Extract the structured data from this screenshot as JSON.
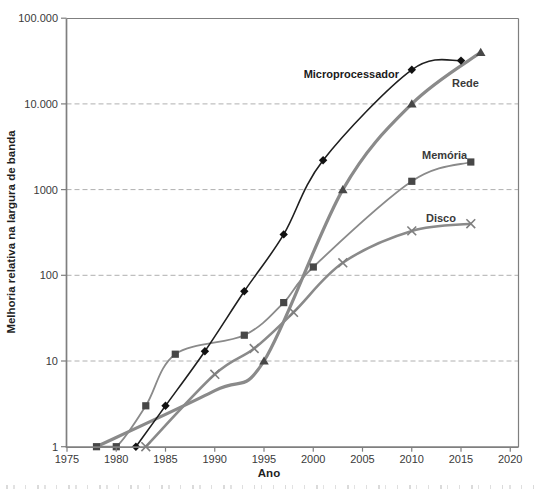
{
  "page": {
    "background": "#ffffff"
  },
  "colors": {
    "frame": "#7f7f7f",
    "grid": "#b0b0b0",
    "tick_text": "#3a3a3a",
    "micro_line": "#1f1f1f",
    "gray_line": "#8a8a8a",
    "dark_marker": "#474747"
  },
  "chart_data": {
    "type": "line",
    "title": "",
    "xlabel": "Ano",
    "ylabel": "Melhoria relativa na largura de banda",
    "x_axis": {
      "min": 1975,
      "max": 2021,
      "tick_step": 5
    },
    "y_axis": {
      "scale": "log",
      "min": 1,
      "max": 100000
    },
    "grid": "horizontal dashed at 10, 100, 1000, 10.000",
    "legend_position": "inline labels next to curves",
    "x_ticks": [
      {
        "label": "1975",
        "value": 1975
      },
      {
        "label": "1980",
        "value": 1980
      },
      {
        "label": "1985",
        "value": 1985
      },
      {
        "label": "1990",
        "value": 1990
      },
      {
        "label": "1995",
        "value": 1995
      },
      {
        "label": "2000",
        "value": 2000
      },
      {
        "label": "2005",
        "value": 2005
      },
      {
        "label": "2010",
        "value": 2010
      },
      {
        "label": "2015",
        "value": 2015
      },
      {
        "label": "2020",
        "value": 2020
      }
    ],
    "y_ticks": [
      {
        "label": "1",
        "value": 1,
        "grid": false
      },
      {
        "label": "10",
        "value": 10,
        "grid": true
      },
      {
        "label": "100",
        "value": 100,
        "grid": true
      },
      {
        "label": "1000",
        "value": 1000,
        "grid": true
      },
      {
        "label": "10.000",
        "value": 10000,
        "grid": true
      },
      {
        "label": "100.000",
        "value": 100000,
        "grid": false
      }
    ],
    "series": [
      {
        "name": "Rede",
        "marker": "triangle",
        "color": "#8a8a8a",
        "marker_color": "#474747",
        "line_width": 3.2,
        "points": [
          [
            1995,
            10
          ],
          [
            2003,
            1000
          ],
          [
            2010,
            10000
          ],
          [
            2017,
            40000
          ]
        ],
        "line_points": [
          [
            1978,
            1
          ],
          [
            1990,
            4.5
          ],
          [
            1995,
            10
          ],
          [
            2003,
            1000
          ],
          [
            2010,
            10000
          ],
          [
            2017,
            40000
          ]
        ]
      },
      {
        "name": "Disco",
        "marker": "x",
        "color": "#8a8a8a",
        "marker_color": "#7f7f7f",
        "line_width": 2.6,
        "points": [
          [
            1983,
            1
          ],
          [
            1990,
            7
          ],
          [
            1994,
            14
          ],
          [
            1998,
            37
          ],
          [
            2003,
            140
          ],
          [
            2010,
            330
          ],
          [
            2016,
            400
          ]
        ]
      },
      {
        "name": "Memória",
        "marker": "square",
        "color": "#8a8a8a",
        "marker_color": "#474747",
        "line_width": 1.8,
        "points": [
          [
            1978,
            1
          ],
          [
            1980,
            1
          ],
          [
            1983,
            3
          ],
          [
            1986,
            12
          ],
          [
            1993,
            20
          ],
          [
            1997,
            48
          ],
          [
            2000,
            125
          ],
          [
            2010,
            1250
          ],
          [
            2016,
            2100
          ]
        ]
      },
      {
        "name": "Microprocessador",
        "marker": "diamond",
        "color": "#1f1f1f",
        "marker_color": "#111111",
        "line_width": 1.6,
        "points": [
          [
            1982,
            1
          ],
          [
            1985,
            3
          ],
          [
            1989,
            13
          ],
          [
            1993,
            65
          ],
          [
            1997,
            300
          ],
          [
            2001,
            2200
          ],
          [
            2010,
            25000
          ],
          [
            2015,
            32000
          ]
        ]
      }
    ]
  },
  "bottom_strip": {
    "description": "tops of a cut-off caption line, illegible"
  }
}
